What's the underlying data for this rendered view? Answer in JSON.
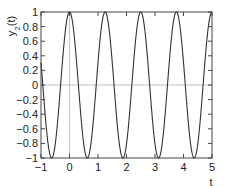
{
  "chart_data": {
    "type": "line",
    "title": "",
    "xlabel": "t",
    "ylabel": "y2(t)",
    "ylabel_display": {
      "base": "y",
      "sub": "2",
      "suffix": "(t)"
    },
    "xlim": [
      -1,
      5
    ],
    "ylim": [
      -1,
      1
    ],
    "xticks": [
      -1,
      0,
      1,
      2,
      3,
      4,
      5
    ],
    "xtick_labels": [
      "−1",
      "0",
      "1",
      "2",
      "3",
      "4",
      "5"
    ],
    "yticks": [
      1,
      0.8,
      0.6,
      0.4,
      0.2,
      0,
      -0.2,
      -0.4,
      -0.6,
      -0.8,
      -1
    ],
    "ytick_labels": [
      "1",
      "0.8",
      "0.6",
      "0.4",
      "0.2",
      "0",
      "−0.2",
      "−0.4",
      "−0.6",
      "−0.8",
      "−1"
    ],
    "grid": false,
    "reference_lines": {
      "horizontal_y": 0,
      "vertical_x": 0
    },
    "legend": null,
    "series": [
      {
        "name": "y2(t)",
        "function": "cos(1.6*pi*t)",
        "period": 1.25,
        "amplitude": 1,
        "peaks_t": [
          0,
          1.25,
          2.5,
          3.75,
          5
        ],
        "troughs_t": [
          -0.625,
          0.625,
          1.875,
          3.125,
          4.375
        ],
        "x": [
          -1,
          -0.625,
          0,
          0.625,
          1.25,
          1.875,
          2.5,
          3.125,
          3.75,
          4.375,
          5
        ],
        "values": [
          -0.81,
          -1,
          1,
          -1,
          1,
          -1,
          1,
          -1,
          1,
          -1,
          1
        ]
      }
    ],
    "colors": {
      "line": "#333333",
      "axis": "#444444",
      "ref_line": "#b0b0b0"
    }
  }
}
